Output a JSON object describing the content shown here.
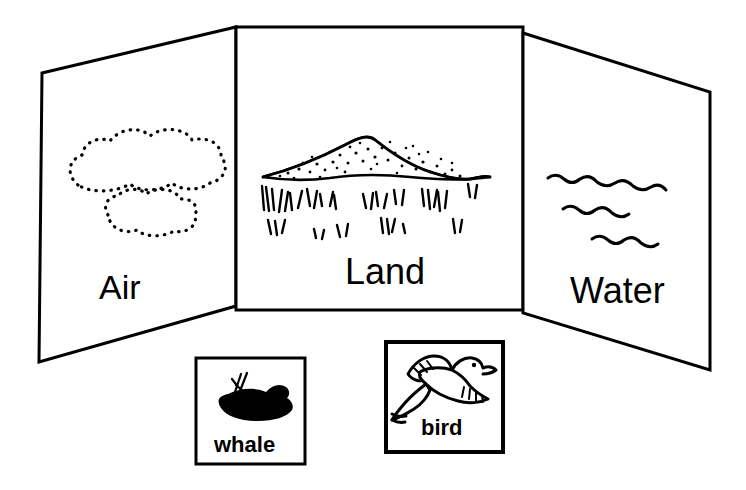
{
  "illustration": {
    "title": "Habitat sorting display board",
    "style": "black-and-white line drawing",
    "ink_color": "#000000",
    "paper_color": "#ffffff"
  },
  "board": {
    "name": "trifold-display-board",
    "panels": [
      {
        "id": "air",
        "label": "Air",
        "scene_icon": "cloud-outline-dotted",
        "scene_description": "two dotted outline clouds"
      },
      {
        "id": "land",
        "label": "Land",
        "scene_icon": "hill-with-grass",
        "scene_description": "stippled hill above tufts of grass"
      },
      {
        "id": "water",
        "label": "Water",
        "scene_icon": "wavy-water-lines",
        "scene_description": "three wavy water lines"
      }
    ]
  },
  "cards": [
    {
      "id": "whale",
      "label": "whale",
      "icon": "whale-silhouette-icon",
      "icon_description": "filled black whale with water spout"
    },
    {
      "id": "bird",
      "label": "bird",
      "icon": "bird-flying-icon",
      "icon_description": "outline drawing of a flying bird"
    }
  ]
}
